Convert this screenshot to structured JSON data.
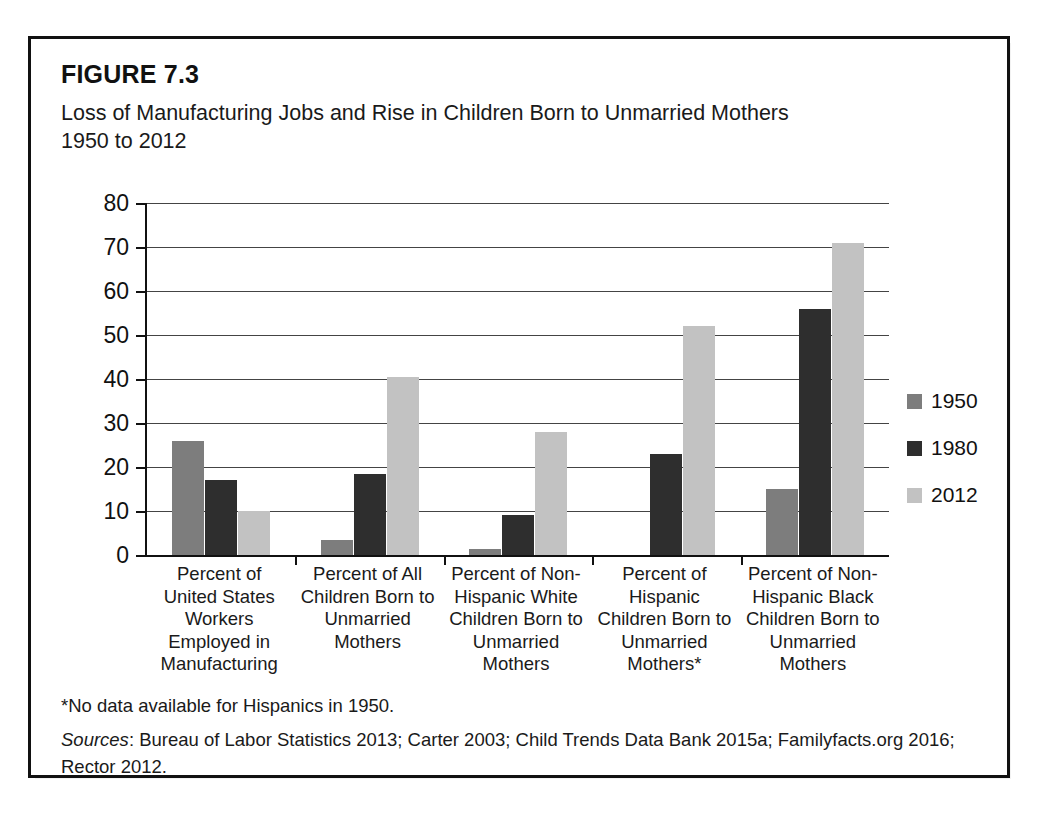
{
  "figure": {
    "label": "FIGURE 7.3",
    "title_line1": "Loss of Manufacturing Jobs and Rise in Children Born to Unmarried Mothers",
    "title_line2": "1950 to 2012",
    "footnote": "*No data available for Hispanics in 1950.",
    "sources_keyword": "Sources",
    "sources_text": ": Bureau of Labor Statistics 2013; Carter 2003; Child Trends Data Bank 2015a; Familyfacts.org 2016; Rector 2012."
  },
  "chart_data": {
    "type": "bar",
    "title": "Loss of Manufacturing Jobs and Rise in Children Born to Unmarried Mothers 1950 to 2012",
    "xlabel": "",
    "ylabel": "",
    "ylim": [
      0,
      80
    ],
    "yticks": [
      0,
      10,
      20,
      30,
      40,
      50,
      60,
      70,
      80
    ],
    "ytick_labels": [
      "0",
      "10",
      "20",
      "30",
      "40",
      "50",
      "60",
      "70",
      "80"
    ],
    "grid": true,
    "legend_position": "right",
    "categories": [
      "Percent of\nUnited States\nWorkers\nEmployed in\nManufacturing",
      "Percent of All\nChildren Born to\nUnmarried\nMothers",
      "Percent of Non-\nHispanic White\nChildren Born to\nUnmarried\nMothers",
      "Percent of\nHispanic\nChildren Born to\nUnmarried\nMothers*",
      "Percent of Non-\nHispanic Black\nChildren Born to\nUnmarried\nMothers"
    ],
    "series": [
      {
        "name": "1950",
        "color": "#7d7d7d",
        "values": [
          26,
          3.5,
          1.3,
          null,
          15
        ]
      },
      {
        "name": "1980",
        "color": "#2e2e2e",
        "values": [
          17,
          18.5,
          9,
          23,
          56
        ]
      },
      {
        "name": "2012",
        "color": "#c2c2c2",
        "values": [
          10,
          40.5,
          28,
          52,
          71
        ]
      }
    ]
  },
  "legend": {
    "items": [
      {
        "label": "1950",
        "color": "#7d7d7d"
      },
      {
        "label": "1980",
        "color": "#2e2e2e"
      },
      {
        "label": "2012",
        "color": "#c2c2c2"
      }
    ]
  }
}
